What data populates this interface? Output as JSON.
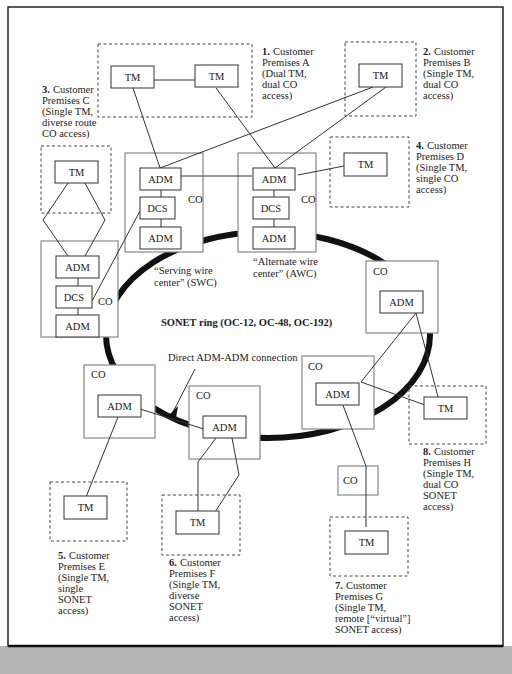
{
  "colors": {
    "background": "#ffffff",
    "frame": "#222222",
    "footer_band": "#b5b5b5",
    "ring": "#111111",
    "co_border": "#888888"
  },
  "ring": {
    "title": "SONET ring (OC-12, OC-48, OC-192)"
  },
  "annotations": {
    "direct": "Direct ADM-ADM connection",
    "swc": [
      "“Serving wire",
      "center” (SWC)"
    ],
    "awc": [
      "“Alternate wire",
      "center” (AWC)"
    ]
  },
  "node_labels": {
    "tm": "TM",
    "adm": "ADM",
    "dcs": "DCS",
    "co": "CO"
  },
  "premises": [
    {
      "num": "1.",
      "lines": [
        "Customer",
        "Premises A",
        "(Dual TM,",
        "dual CO",
        "access)"
      ]
    },
    {
      "num": "2.",
      "lines": [
        "Customer",
        "Premises B",
        "(Single TM,",
        "dual CO",
        "access)"
      ]
    },
    {
      "num": "3.",
      "lines": [
        "Customer",
        "Premises C",
        "(Single TM,",
        "diverse route",
        "CO access)"
      ]
    },
    {
      "num": "4.",
      "lines": [
        "Customer",
        "Premises D",
        "(Single TM,",
        "single CO",
        "access)"
      ]
    },
    {
      "num": "5.",
      "lines": [
        "Customer",
        "Premises E",
        "(Single TM,",
        "single",
        "SONET",
        "access)"
      ]
    },
    {
      "num": "6.",
      "lines": [
        "Customer",
        "Premises F",
        "(Single TM,",
        "diverse",
        "SONET",
        "access)"
      ]
    },
    {
      "num": "7.",
      "lines": [
        "Customer",
        "Premises G",
        "(Single TM,",
        "remote [“virtual”]",
        " SONET access)"
      ]
    },
    {
      "num": "8.",
      "lines": [
        "Customer",
        "Premises H",
        "(Single TM,",
        "dual CO",
        "SONET",
        "access)"
      ]
    }
  ]
}
